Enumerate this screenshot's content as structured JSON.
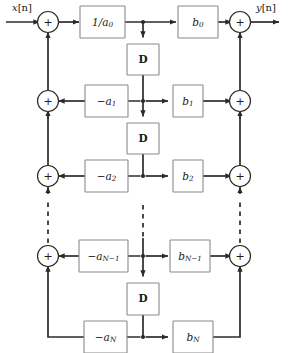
{
  "diagram": {
    "colors": {
      "wire": "#2b2b2b",
      "box_stroke": "#8a8a8a",
      "background": "#ffffff",
      "text": "#1a1a1a"
    },
    "io": {
      "input_label": "x[n]",
      "input_base": "x",
      "input_index": "[n]",
      "output_label": "y[n]",
      "output_base": "y",
      "output_index": "[n]"
    },
    "adder_symbol": "+",
    "delay_label": "D",
    "feedback_boxes": [
      {
        "label": "1/a0",
        "base": "1/a",
        "sub": "0",
        "row": 0
      },
      {
        "label": "-a1",
        "base": "−a",
        "sub": "1",
        "row": 1
      },
      {
        "label": "-a2",
        "base": "−a",
        "sub": "2",
        "row": 2
      },
      {
        "label": "-aN-1",
        "base": "−a",
        "sub": "N−1",
        "row": 3
      },
      {
        "label": "-aN",
        "base": "−a",
        "sub": "N",
        "row": 4
      }
    ],
    "feedforward_boxes": [
      {
        "label": "b0",
        "base": "b",
        "sub": "0",
        "row": 0
      },
      {
        "label": "b1",
        "base": "b",
        "sub": "1",
        "row": 1
      },
      {
        "label": "b2",
        "base": "b",
        "sub": "2",
        "row": 2
      },
      {
        "label": "bN-1",
        "base": "b",
        "sub": "N−1",
        "row": 3
      },
      {
        "label": "bN",
        "base": "b",
        "sub": "N",
        "row": 4
      }
    ],
    "delay_blocks": [
      {
        "label": "D",
        "between_rows": "0-1"
      },
      {
        "label": "D",
        "between_rows": "1-2"
      },
      {
        "label": "D",
        "between_rows": "3-4"
      }
    ],
    "adders_left": [
      {
        "symbol": "+",
        "row": 0
      },
      {
        "symbol": "+",
        "row": 1
      },
      {
        "symbol": "+",
        "row": 2
      },
      {
        "symbol": "+",
        "row": 3
      }
    ],
    "adders_right": [
      {
        "symbol": "+",
        "row": 0
      },
      {
        "symbol": "+",
        "row": 1
      },
      {
        "symbol": "+",
        "row": 2
      },
      {
        "symbol": "+",
        "row": 3
      }
    ],
    "ellipsis_note": "dashed vertical continuation between row 2 and row N-1 on left, center and right rails"
  }
}
